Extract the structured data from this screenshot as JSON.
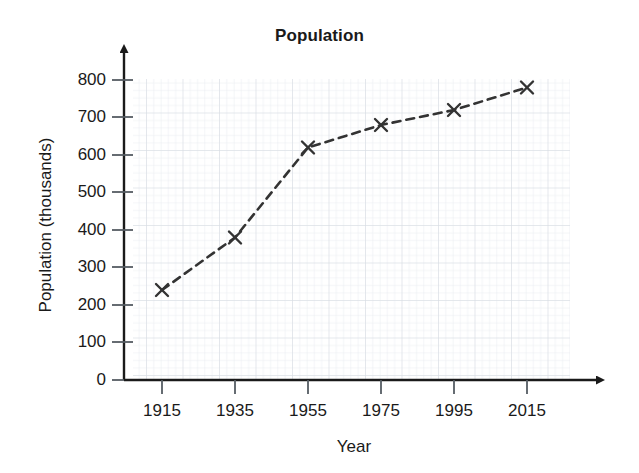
{
  "chart_data": {
    "type": "line",
    "title": "Population",
    "xlabel": "Year",
    "ylabel": "Population (thousands)",
    "x": [
      1915,
      1935,
      1955,
      1975,
      1995,
      2015
    ],
    "values": [
      240,
      380,
      620,
      680,
      720,
      780
    ],
    "xtick_labels": [
      "1915",
      "1935",
      "1955",
      "1975",
      "1995",
      "2015"
    ],
    "ytick_labels": [
      "0",
      "100",
      "200",
      "300",
      "400",
      "500",
      "600",
      "700",
      "800"
    ],
    "yticks": [
      0,
      100,
      200,
      300,
      400,
      500,
      600,
      700,
      800
    ],
    "xlim": [
      1905,
      2030
    ],
    "ylim": [
      0,
      850
    ],
    "grid": true,
    "grid_style": "graph-paper",
    "legend": null,
    "marker": "x-marker",
    "line_style": "dashed",
    "line_color": "#333333",
    "grid_minor_color": "#e9ecf0",
    "grid_major_color": "#d7dce3",
    "axis_color": "#1a1a1a",
    "axis_arrows": [
      "y-axis-up",
      "x-axis-right"
    ]
  }
}
